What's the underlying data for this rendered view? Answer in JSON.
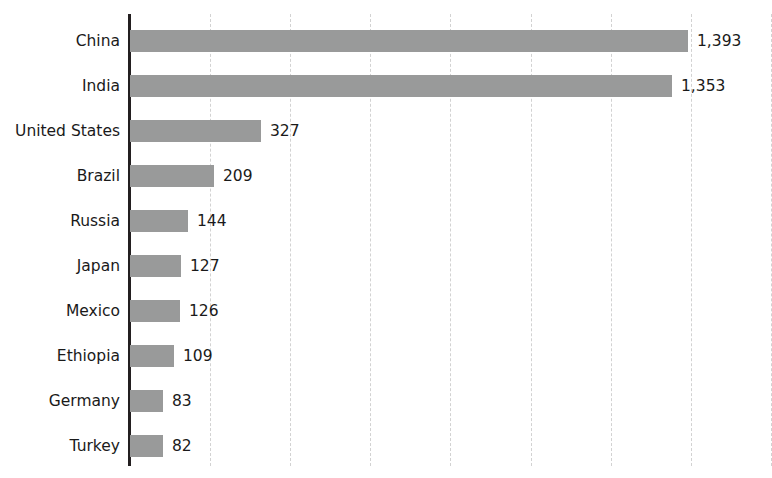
{
  "top_clipped_text": "",
  "chart_data": {
    "type": "bar",
    "orientation": "horizontal",
    "title": "",
    "subtitle": "",
    "xlabel": "",
    "ylabel": "",
    "categories": [
      "China",
      "India",
      "United States",
      "Brazil",
      "Russia",
      "Japan",
      "Mexico",
      "Ethiopia",
      "Germany",
      "Turkey"
    ],
    "values": [
      1393,
      1353,
      327,
      209,
      144,
      127,
      126,
      109,
      83,
      82
    ],
    "value_labels": [
      "1,393",
      "1,353",
      "327",
      "209",
      "144",
      "127",
      "126",
      "109",
      "83",
      "82"
    ],
    "xlim": [
      0,
      1600
    ],
    "grid": true,
    "grid_axis": "x",
    "gridline_values": [
      200,
      400,
      600,
      800,
      1000,
      1200,
      1400,
      1600
    ],
    "x_tick_labels": [],
    "legend": null,
    "legend_position": "none",
    "bar_color": "#999a9a",
    "axis_color": "#231f20",
    "grid_color": "#d2d2d2",
    "label_color": "#1a1a1a",
    "background_color": "#ffffff"
  }
}
